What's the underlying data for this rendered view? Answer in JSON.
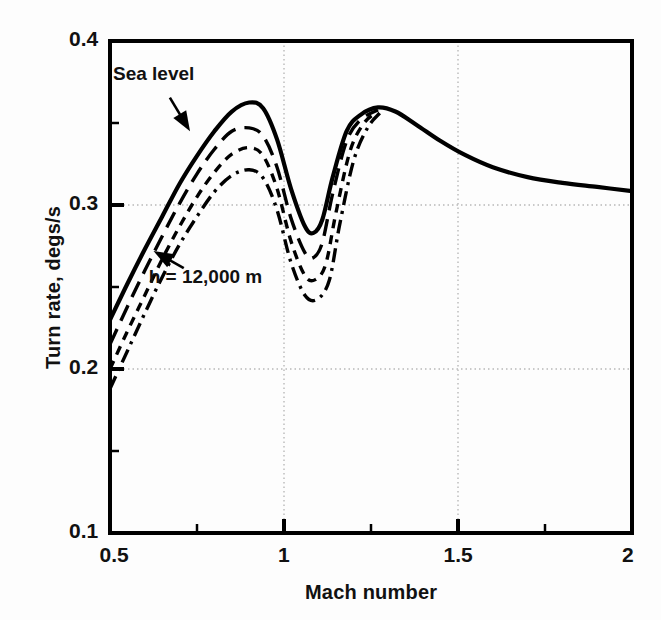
{
  "chart_data": {
    "type": "line",
    "title": "",
    "xlabel": "Mach number",
    "ylabel": "Turn rate, degs/s",
    "xlim": [
      0.5,
      2.0
    ],
    "ylim": [
      0.1,
      0.4
    ],
    "xticks": [
      "0.5",
      "1",
      "1.5",
      "2"
    ],
    "xtick_values": [
      0.5,
      1.0,
      1.5,
      2.0
    ],
    "xminor_values": [
      0.75,
      1.25,
      1.75
    ],
    "yticks": [
      "0.1",
      "0.2",
      "0.3",
      "0.4"
    ],
    "ytick_values": [
      0.1,
      0.2,
      0.3,
      0.4
    ],
    "yminor_values": [
      0.15,
      0.25,
      0.35
    ],
    "grid": true,
    "grid_style": "dotted",
    "legend": "none",
    "line_color": "#000000",
    "annotations": [
      {
        "text": "Sea level",
        "x": 0.62,
        "y": 0.378,
        "arrow_to_x": 0.73,
        "arrow_to_y": 0.345
      },
      {
        "text": "h = 12,000 m",
        "x": 0.695,
        "y": 0.252,
        "arrow_to_x": 0.625,
        "arrow_to_y": 0.272
      }
    ],
    "series": [
      {
        "name": "Sea level",
        "dash": "solid",
        "x": [
          0.5,
          0.55,
          0.6,
          0.65,
          0.7,
          0.75,
          0.8,
          0.85,
          0.9,
          0.94,
          0.98,
          1.02,
          1.06,
          1.085,
          1.11,
          1.14,
          1.18,
          1.22,
          1.27,
          1.32,
          1.38,
          1.45,
          1.52,
          1.6,
          1.7,
          1.8,
          1.9,
          2.0
        ],
        "values": [
          0.23,
          0.252,
          0.273,
          0.293,
          0.313,
          0.33,
          0.345,
          0.357,
          0.3625,
          0.359,
          0.34,
          0.31,
          0.287,
          0.283,
          0.291,
          0.317,
          0.345,
          0.355,
          0.3595,
          0.357,
          0.349,
          0.339,
          0.3305,
          0.323,
          0.317,
          0.3135,
          0.311,
          0.3085
        ]
      },
      {
        "name": "h intermediate 1",
        "dash": "long-dash",
        "x": [
          0.5,
          0.55,
          0.6,
          0.65,
          0.7,
          0.75,
          0.8,
          0.85,
          0.9,
          0.94,
          0.98,
          1.02,
          1.06,
          1.085,
          1.11,
          1.14,
          1.18,
          1.22,
          1.27
        ],
        "values": [
          0.215,
          0.238,
          0.26,
          0.281,
          0.301,
          0.319,
          0.334,
          0.345,
          0.347,
          0.342,
          0.323,
          0.292,
          0.271,
          0.268,
          0.277,
          0.307,
          0.339,
          0.352,
          0.358
        ]
      },
      {
        "name": "h intermediate 2",
        "dash": "short-dash",
        "x": [
          0.5,
          0.55,
          0.6,
          0.65,
          0.7,
          0.75,
          0.8,
          0.85,
          0.9,
          0.94,
          0.98,
          1.02,
          1.06,
          1.09,
          1.12,
          1.15,
          1.19,
          1.23,
          1.27
        ],
        "values": [
          0.2,
          0.223,
          0.245,
          0.267,
          0.287,
          0.305,
          0.32,
          0.331,
          0.335,
          0.33,
          0.31,
          0.278,
          0.257,
          0.2545,
          0.264,
          0.296,
          0.333,
          0.35,
          0.357
        ]
      },
      {
        "name": "h = 12,000 m",
        "dash": "dash-dot",
        "x": [
          0.5,
          0.55,
          0.6,
          0.65,
          0.7,
          0.75,
          0.8,
          0.85,
          0.9,
          0.94,
          0.98,
          1.02,
          1.06,
          1.095,
          1.13,
          1.16,
          1.2,
          1.24,
          1.275
        ],
        "values": [
          0.188,
          0.211,
          0.234,
          0.256,
          0.276,
          0.293,
          0.308,
          0.318,
          0.3215,
          0.3165,
          0.297,
          0.265,
          0.245,
          0.2425,
          0.254,
          0.288,
          0.327,
          0.347,
          0.356
        ]
      }
    ]
  },
  "axes": {
    "y_axis_label": "Turn rate, degs/s",
    "x_axis_label": "Mach number"
  }
}
